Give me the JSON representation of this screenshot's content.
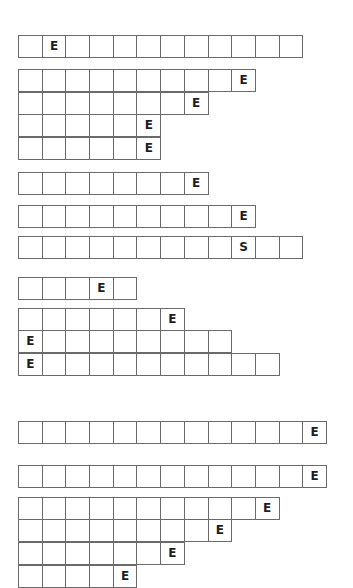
{
  "groups": [
    {
      "rows": [
        {
          "top": 35,
          "cells": [
            "",
            "E",
            "",
            "",
            "",
            "",
            "",
            "",
            "",
            "",
            "",
            ""
          ]
        }
      ]
    },
    {
      "rows": [
        {
          "top": 69,
          "cells": [
            "",
            "",
            "",
            "",
            "",
            "",
            "",
            "",
            "",
            "E"
          ]
        },
        {
          "top": 92,
          "cells": [
            "",
            "",
            "",
            "",
            "",
            "",
            "",
            "E"
          ]
        },
        {
          "top": 114,
          "cells": [
            "",
            "",
            "",
            "",
            "",
            "E"
          ]
        },
        {
          "top": 137,
          "cells": [
            "",
            "",
            "",
            "",
            "",
            "E"
          ]
        }
      ]
    },
    {
      "rows": [
        {
          "top": 172,
          "cells": [
            "",
            "",
            "",
            "",
            "",
            "",
            "",
            "E"
          ]
        }
      ]
    },
    {
      "rows": [
        {
          "top": 205,
          "cells": [
            "",
            "",
            "",
            "",
            "",
            "",
            "",
            "",
            "",
            "E"
          ]
        }
      ]
    },
    {
      "rows": [
        {
          "top": 236,
          "cells": [
            "",
            "",
            "",
            "",
            "",
            "",
            "",
            "",
            "",
            "S",
            "",
            ""
          ]
        }
      ]
    },
    {
      "rows": [
        {
          "top": 277,
          "cells": [
            "",
            "",
            "",
            "E",
            ""
          ]
        }
      ]
    },
    {
      "rows": [
        {
          "top": 308,
          "cells": [
            "",
            "",
            "",
            "",
            "",
            "",
            "E"
          ]
        },
        {
          "top": 330,
          "cells": [
            "E",
            "",
            "",
            "",
            "",
            "",
            "",
            "",
            ""
          ]
        },
        {
          "top": 353,
          "cells": [
            "E",
            "",
            "",
            "",
            "",
            "",
            "",
            "",
            "",
            "",
            ""
          ]
        }
      ]
    },
    {
      "rows": [
        {
          "top": 421,
          "cells": [
            "",
            "",
            "",
            "",
            "",
            "",
            "",
            "",
            "",
            "",
            "",
            "",
            "E"
          ]
        }
      ]
    },
    {
      "rows": [
        {
          "top": 465,
          "cells": [
            "",
            "",
            "",
            "",
            "",
            "",
            "",
            "",
            "",
            "",
            "",
            "",
            "E"
          ]
        }
      ]
    },
    {
      "rows": [
        {
          "top": 497,
          "cells": [
            "",
            "",
            "",
            "",
            "",
            "",
            "",
            "",
            "",
            "",
            "E"
          ]
        },
        {
          "top": 519,
          "cells": [
            "",
            "",
            "",
            "",
            "",
            "",
            "",
            "",
            "E"
          ]
        },
        {
          "top": 542,
          "cells": [
            "",
            "",
            "",
            "",
            "",
            "",
            "E"
          ]
        },
        {
          "top": 565,
          "cells": [
            "",
            "",
            "",
            "",
            "E"
          ]
        }
      ]
    }
  ]
}
